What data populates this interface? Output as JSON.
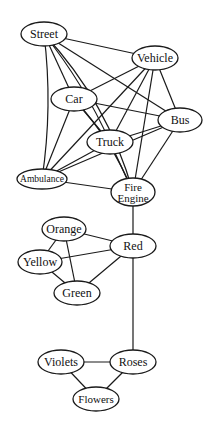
{
  "diagram": {
    "type": "undirected-graph",
    "colors": {
      "background": "#ffffff",
      "stroke": "#1a1a1a",
      "text": "#111111"
    },
    "nodes": [
      {
        "id": "street",
        "label": "Street",
        "x": 44,
        "y": 34,
        "rx": 23,
        "ry": 12,
        "size": 12
      },
      {
        "id": "vehicle",
        "label": "Vehicle",
        "x": 155,
        "y": 58,
        "rx": 23,
        "ry": 12,
        "size": 12
      },
      {
        "id": "car",
        "label": "Car",
        "x": 74,
        "y": 99,
        "rx": 23,
        "ry": 12,
        "size": 12
      },
      {
        "id": "bus",
        "label": "Bus",
        "x": 180,
        "y": 120,
        "rx": 22,
        "ry": 12,
        "size": 12
      },
      {
        "id": "truck",
        "label": "Truck",
        "x": 110,
        "y": 142,
        "rx": 23,
        "ry": 12,
        "size": 12
      },
      {
        "id": "ambulance",
        "label": "Ambulance",
        "x": 42,
        "y": 179,
        "rx": 25,
        "ry": 10,
        "size": 9.5
      },
      {
        "id": "fire",
        "label": "Fire",
        "label2": "Engine",
        "x": 133,
        "y": 192,
        "rx": 22,
        "ry": 14,
        "size": 11
      },
      {
        "id": "orange",
        "label": "Orange",
        "x": 64,
        "y": 229,
        "rx": 22,
        "ry": 12,
        "size": 12
      },
      {
        "id": "red",
        "label": "Red",
        "x": 133,
        "y": 246,
        "rx": 23,
        "ry": 12,
        "size": 12
      },
      {
        "id": "yellow",
        "label": "Yellow",
        "x": 40,
        "y": 262,
        "rx": 22,
        "ry": 12,
        "size": 12
      },
      {
        "id": "green",
        "label": "Green",
        "x": 77,
        "y": 293,
        "rx": 23,
        "ry": 12,
        "size": 12
      },
      {
        "id": "violets",
        "label": "Violets",
        "x": 61,
        "y": 362,
        "rx": 23,
        "ry": 12,
        "size": 12
      },
      {
        "id": "roses",
        "label": "Roses",
        "x": 133,
        "y": 362,
        "rx": 23,
        "ry": 12,
        "size": 12
      },
      {
        "id": "flowers",
        "label": "Flowers",
        "x": 96,
        "y": 399,
        "rx": 23,
        "ry": 12,
        "size": 11
      }
    ],
    "edges": [
      {
        "from": "street",
        "to": "vehicle"
      },
      {
        "from": "street",
        "to": "car"
      },
      {
        "from": "street",
        "to": "truck",
        "curve": 8
      },
      {
        "from": "street",
        "to": "bus"
      },
      {
        "from": "street",
        "to": "ambulance",
        "curve": 10
      },
      {
        "from": "street",
        "to": "fire",
        "curve": 22
      },
      {
        "from": "vehicle",
        "to": "car"
      },
      {
        "from": "vehicle",
        "to": "truck"
      },
      {
        "from": "vehicle",
        "to": "bus"
      },
      {
        "from": "vehicle",
        "to": "ambulance"
      },
      {
        "from": "vehicle",
        "to": "fire"
      },
      {
        "from": "car",
        "to": "bus"
      },
      {
        "from": "car",
        "to": "truck"
      },
      {
        "from": "car",
        "to": "ambulance"
      },
      {
        "from": "car",
        "to": "fire",
        "curve": 10
      },
      {
        "from": "bus",
        "to": "truck"
      },
      {
        "from": "bus",
        "to": "ambulance"
      },
      {
        "from": "bus",
        "to": "fire"
      },
      {
        "from": "truck",
        "to": "ambulance"
      },
      {
        "from": "truck",
        "to": "fire"
      },
      {
        "from": "ambulance",
        "to": "fire"
      },
      {
        "from": "fire",
        "to": "red"
      },
      {
        "from": "red",
        "to": "orange"
      },
      {
        "from": "red",
        "to": "yellow"
      },
      {
        "from": "red",
        "to": "green"
      },
      {
        "from": "red",
        "to": "roses"
      },
      {
        "from": "orange",
        "to": "yellow"
      },
      {
        "from": "orange",
        "to": "green"
      },
      {
        "from": "yellow",
        "to": "green"
      },
      {
        "from": "roses",
        "to": "violets"
      },
      {
        "from": "roses",
        "to": "flowers"
      },
      {
        "from": "violets",
        "to": "flowers"
      }
    ]
  }
}
